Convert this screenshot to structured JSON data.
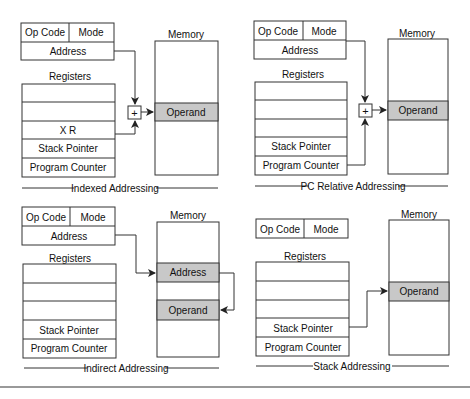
{
  "panels": [
    {
      "id": "indexed",
      "caption": "Indexed Addressing",
      "instruction": {
        "opcode": "Op Code",
        "mode": "Mode",
        "address": "Address"
      },
      "registers_label": "Registers",
      "registers": [
        "",
        "",
        "X R",
        "Stack Pointer",
        "Program Counter"
      ],
      "memory_label": "Memory",
      "memory_cells": [
        "Operand"
      ],
      "adder": "+"
    },
    {
      "id": "pc-relative",
      "caption": "PC Relative Addressing",
      "instruction": {
        "opcode": "Op Code",
        "mode": "Mode",
        "address": "Address"
      },
      "registers_label": "Registers",
      "registers": [
        "",
        "",
        "",
        "Stack Pointer",
        "Program Counter"
      ],
      "memory_label": "Memory",
      "memory_cells": [
        "Operand"
      ],
      "adder": "+"
    },
    {
      "id": "indirect",
      "caption": "Indirect Addressing",
      "instruction": {
        "opcode": "Op Code",
        "mode": "Mode",
        "address": "Address"
      },
      "registers_label": "Registers",
      "registers": [
        "",
        "",
        "",
        "Stack Pointer",
        "Program Counter"
      ],
      "memory_label": "Memory",
      "memory_cells": [
        "Address",
        "Operand"
      ]
    },
    {
      "id": "stack",
      "caption": "Stack Addressing",
      "instruction": {
        "opcode": "Op Code",
        "mode": "Mode"
      },
      "registers_label": "Registers",
      "registers": [
        "",
        "",
        "",
        "Stack Pointer",
        "Program Counter"
      ],
      "memory_label": "Memory",
      "memory_cells": [
        "Operand"
      ]
    }
  ],
  "colors": {
    "line": "#333333",
    "shade": "#c8c8c8"
  }
}
